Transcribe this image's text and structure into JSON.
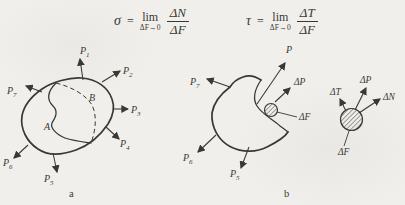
{
  "colors": {
    "ink": "#3a3834",
    "paper": "#f1efeb"
  },
  "formulas": {
    "sigma": {
      "lhs": "σ",
      "eq": "=",
      "lim": "lim",
      "lim_sub": "ΔF→0",
      "num": "ΔN",
      "den": "ΔF"
    },
    "tau": {
      "lhs": "τ",
      "eq": "=",
      "lim": "lim",
      "lim_sub": "ΔF→0",
      "num": "ΔT",
      "den": "ΔF"
    }
  },
  "diagram_a": {
    "caption": "a",
    "region_a": "A",
    "region_b": "B",
    "forces": {
      "p1": {
        "m": "P",
        "s": "1"
      },
      "p2": {
        "m": "P",
        "s": "2"
      },
      "p3": {
        "m": "P",
        "s": "3"
      },
      "p4": {
        "m": "P",
        "s": "4"
      },
      "p5": {
        "m": "P",
        "s": "5"
      },
      "p6": {
        "m": "P",
        "s": "6"
      },
      "p7": {
        "m": "P",
        "s": "7"
      }
    }
  },
  "diagram_b": {
    "caption": "b",
    "resultant": "P",
    "delta_p": "ΔP",
    "delta_f": "ΔF",
    "forces": {
      "p5": {
        "m": "P",
        "s": "5"
      },
      "p6": {
        "m": "P",
        "s": "6"
      },
      "p7": {
        "m": "P",
        "s": "7"
      }
    }
  },
  "detail": {
    "delta_p": "ΔP",
    "delta_t": "ΔT",
    "delta_n": "ΔN",
    "delta_f": "ΔF"
  }
}
